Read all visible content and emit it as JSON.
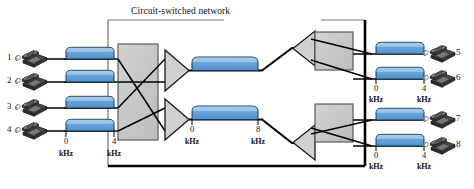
{
  "diagram": {
    "title": "Circuit-switched network",
    "network_box": {
      "x": 108,
      "y": 20,
      "width": 257,
      "height": 146
    },
    "colors": {
      "spectrum_fill": "#5b9bd5",
      "spectrum_fill_top": "#8fbce6",
      "spectrum_stroke": "#1f3b57",
      "switch_fill": "#c9c9c9",
      "switch_stroke": "#555555",
      "line": "#000000",
      "phone_dark": "#3a3a3a",
      "phone_light": "#8a8a8a",
      "text": "#111111"
    },
    "left_endpoints": [
      {
        "number": "1",
        "phone_icon": "telephone-icon",
        "y": 59
      },
      {
        "number": "2",
        "phone_icon": "telephone-icon",
        "y": 82
      },
      {
        "number": "3",
        "phone_icon": "telephone-icon",
        "y": 108
      },
      {
        "number": "4",
        "phone_icon": "telephone-icon",
        "y": 131
      }
    ],
    "right_endpoints": [
      {
        "number": "5",
        "phone_icon": "telephone-icon",
        "y": 54
      },
      {
        "number": "6",
        "phone_icon": "telephone-icon",
        "y": 79
      },
      {
        "number": "7",
        "phone_icon": "telephone-icon",
        "y": 120
      },
      {
        "number": "8",
        "phone_icon": "telephone-icon",
        "y": 146
      }
    ],
    "left_axis": {
      "start_label": {
        "value": "0",
        "unit": "kHz"
      },
      "end_label": {
        "value": "4",
        "unit": "kHz"
      }
    },
    "right_axis_top": {
      "start_label": {
        "value": "0",
        "unit": "kHz"
      },
      "end_label": {
        "value": "4",
        "unit": "kHz"
      }
    },
    "right_axis_bottom": {
      "start_label": {
        "value": "0",
        "unit": "kHz"
      },
      "end_label": {
        "value": "4",
        "unit": "kHz"
      }
    },
    "trunk_axis": {
      "start_label": {
        "value": "0",
        "unit": "kHz"
      },
      "end_label": {
        "value": "8",
        "unit": "kHz"
      }
    },
    "switches": [
      {
        "name": "ingress-crossbar-switch",
        "x": 118,
        "y": 44,
        "width": 40,
        "height": 96
      },
      {
        "name": "egress-crossbar-switch-top",
        "x": 315,
        "y": 32,
        "width": 38,
        "height": 38
      },
      {
        "name": "egress-crossbar-switch-bottom",
        "x": 315,
        "y": 104,
        "width": 38,
        "height": 38
      }
    ],
    "multiplexers": [
      {
        "name": "multiplexer-top",
        "direction": "right"
      },
      {
        "name": "multiplexer-bottom",
        "direction": "right"
      },
      {
        "name": "demultiplexer-top",
        "direction": "left"
      },
      {
        "name": "demultiplexer-bottom",
        "direction": "left"
      }
    ],
    "spectra": [
      {
        "name": "spectrum-subscriber-1",
        "band": "0-4 kHz"
      },
      {
        "name": "spectrum-subscriber-2",
        "band": "0-4 kHz"
      },
      {
        "name": "spectrum-subscriber-3",
        "band": "0-4 kHz"
      },
      {
        "name": "spectrum-subscriber-4",
        "band": "0-4 kHz"
      },
      {
        "name": "spectrum-trunk-top",
        "band": "0-8 kHz"
      },
      {
        "name": "spectrum-trunk-bottom",
        "band": "0-8 kHz"
      },
      {
        "name": "spectrum-subscriber-5",
        "band": "0-4 kHz"
      },
      {
        "name": "spectrum-subscriber-6",
        "band": "0-4 kHz"
      },
      {
        "name": "spectrum-subscriber-7",
        "band": "0-4 kHz"
      },
      {
        "name": "spectrum-subscriber-8",
        "band": "0-4 kHz"
      }
    ]
  }
}
